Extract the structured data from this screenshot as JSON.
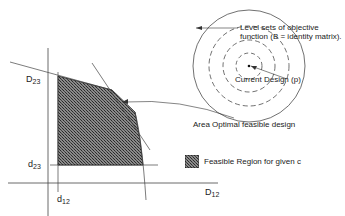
{
  "diagram": {
    "annotations": {
      "level_sets_line1": "Level sets of objective",
      "level_sets_line2": "function (B = identity matrix).",
      "current_design": "Current Design (p)",
      "optimal": "Area Optimal feasible design",
      "legend": "Feasible Region for given c"
    },
    "axis_labels": {
      "D23_main": "D",
      "D23_sub": "23",
      "d23_main": "d",
      "d23_sub": "23",
      "d12_main": "d",
      "d12_sub": "12",
      "D12_main": "D",
      "D12_sub": "12"
    },
    "colors": {
      "line": "#333333",
      "fill_dark": "#3a3a3a",
      "fill_light": "#9a9a9a"
    }
  }
}
